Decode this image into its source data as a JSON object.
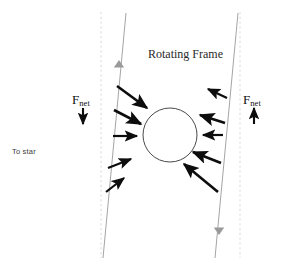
{
  "figure": {
    "title_label": "Rotating Frame",
    "to_star_label": "To star",
    "fnet_left": {
      "symbol": "F",
      "subscript": "net",
      "direction": "down"
    },
    "fnet_right": {
      "symbol": "F",
      "subscript": "net",
      "direction": "up"
    },
    "colors": {
      "background": "#ffffff",
      "arrow": "#0d0d0d",
      "guide_line": "#9a9a9a",
      "dashed_line": "#d9d9d9",
      "circle_stroke": "#4a4a4a",
      "marker_gray": "#9a9a9a",
      "text": "#1b1b1b"
    },
    "circle": {
      "cx": 170,
      "cy": 135,
      "r": 27
    },
    "dashed_lines": [
      {
        "name": "left-dashed-axis",
        "x": 101,
        "y1": 12,
        "y2": 258
      },
      {
        "name": "right-dashed-axis",
        "x": 240,
        "y1": 12,
        "y2": 258
      }
    ],
    "guide_lines": [
      {
        "name": "left-orbit-line",
        "x1": 126,
        "y1": 13,
        "x2": 103,
        "y2": 258,
        "marker": "up-triangle",
        "marker_x": 119,
        "marker_y": 60
      },
      {
        "name": "right-orbit-line",
        "x1": 238,
        "y1": 13,
        "x2": 215,
        "y2": 258,
        "marker": "down-triangle",
        "marker_x": 219,
        "marker_y": 235
      }
    ],
    "force_arrows_left": [
      {
        "name": "force-arrow-left-1",
        "x1": 117,
        "y1": 86,
        "x2": 147,
        "y2": 108
      },
      {
        "name": "force-arrow-left-2",
        "x1": 114,
        "y1": 110,
        "x2": 141,
        "y2": 124
      },
      {
        "name": "force-arrow-left-3",
        "x1": 113,
        "y1": 136,
        "x2": 137,
        "y2": 136
      },
      {
        "name": "force-arrow-left-4",
        "x1": 108,
        "y1": 168,
        "x2": 131,
        "y2": 159
      },
      {
        "name": "force-arrow-left-5",
        "x1": 106,
        "y1": 192,
        "x2": 124,
        "y2": 178
      }
    ],
    "force_arrows_right": [
      {
        "name": "force-arrow-right-1",
        "x1": 227,
        "y1": 98,
        "x2": 208,
        "y2": 89
      },
      {
        "name": "force-arrow-right-2",
        "x1": 225,
        "y1": 123,
        "x2": 200,
        "y2": 115
      },
      {
        "name": "force-arrow-right-3",
        "x1": 223,
        "y1": 135,
        "x2": 203,
        "y2": 135
      },
      {
        "name": "force-arrow-right-4",
        "x1": 221,
        "y1": 163,
        "x2": 193,
        "y2": 152
      },
      {
        "name": "force-arrow-right-5",
        "x1": 218,
        "y1": 192,
        "x2": 184,
        "y2": 164
      }
    ],
    "fnet_arrow_left": {
      "x": 83,
      "y1": 108,
      "y2": 124,
      "direction": "down"
    },
    "fnet_arrow_right": {
      "x": 254,
      "y1": 124,
      "y2": 108,
      "direction": "up"
    }
  }
}
